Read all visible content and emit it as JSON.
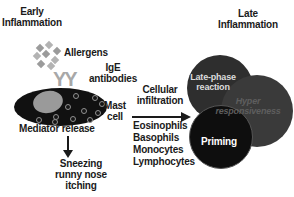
{
  "titles": {
    "early": {
      "line1": "Early",
      "line2": "Inflammation"
    },
    "late": {
      "line1": "Late",
      "line2": "Inflammation"
    }
  },
  "early_path": {
    "allergens_label": "Allergens",
    "ige_label": {
      "line1": "IgE",
      "line2": "antibodies"
    },
    "ige_icon_glyphs": "YY",
    "mast_cell_label": {
      "line1": "Mast",
      "line2": "cell"
    },
    "mediator_label": "Mediator release",
    "symptoms": {
      "line1": "Sneezing",
      "line2": "runny nose",
      "line3": "itching"
    }
  },
  "transition": {
    "cellular_label": {
      "line1": "Cellular",
      "line2": "infiltration"
    },
    "cell_types": [
      "Eosinophils",
      "Basophils",
      "Monocytes",
      "Lymphocytes"
    ]
  },
  "late_path": {
    "late_phase": {
      "line1": "Late-phase",
      "line2": "reaction"
    },
    "hyper": {
      "line1": "Hyper",
      "line2": "responsiveness"
    },
    "priming": "Priming"
  },
  "colors": {
    "background": "#ffffff",
    "text": "#1a1a1a",
    "mast_cell_fill": "#111111",
    "nucleus": "#9a9a9a",
    "granule_ring": "#909090",
    "allergen_diamond": "#9b9b9b",
    "antibody_gray": "#a8a8a8",
    "late_phase_circle": "#2e2e2e",
    "hyper_circle": "#3a3a3a",
    "priming_circle": "#0e0e0e",
    "late_phase_text": "#dcdcdc",
    "hyper_text": "#5e5e5e",
    "priming_text": "#ffffff"
  }
}
